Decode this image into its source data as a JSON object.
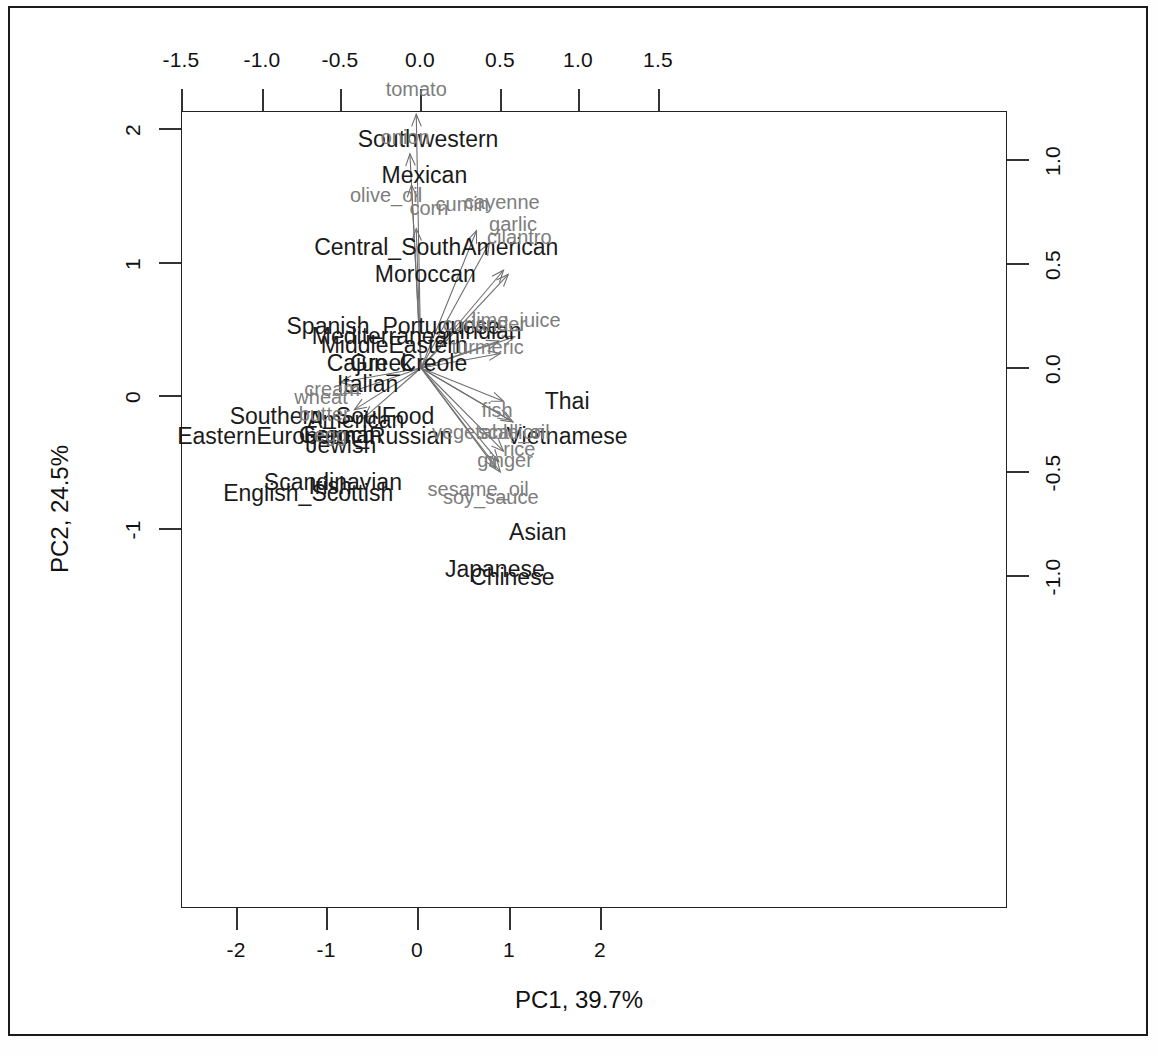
{
  "figure": {
    "type": "pca-biplot",
    "x_axis_title": "PC1, 39.7%",
    "y_axis_title": "PC2, 24.5%"
  },
  "chart_data": {
    "type": "scatter",
    "title": "",
    "subtitle": "",
    "xlabel": "PC1, 39.7%",
    "ylabel": "PC2, 24.5%",
    "grid": false,
    "legend": "none",
    "bottom_axis": {
      "name": "PC1 scores",
      "ticks": [
        -2,
        -1,
        0,
        1,
        2
      ],
      "tick_labels": [
        "-2",
        "-1",
        "0",
        "1",
        "2"
      ],
      "xlim": [
        -2.95,
        2.45
      ]
    },
    "top_axis": {
      "name": "PC1 loadings",
      "ticks": [
        -1.5,
        -1.0,
        -0.5,
        0.0,
        0.5,
        1.0,
        1.5
      ],
      "tick_labels": [
        "-1.5",
        "-1.0",
        "-0.5",
        "0.0",
        "0.5",
        "1.0",
        "1.5"
      ],
      "xlim": [
        -1.63,
        1.63
      ]
    },
    "left_axis": {
      "name": "PC2 scores",
      "ticks": [
        2,
        1,
        0,
        -1
      ],
      "tick_labels": [
        "2",
        "1",
        "0",
        "-1"
      ],
      "ylim": [
        -1.55,
        2.2
      ]
    },
    "right_axis": {
      "name": "PC2 loadings",
      "ticks": [
        1.0,
        0.5,
        0.0,
        -0.5,
        -1.0
      ],
      "tick_labels": [
        "1.0",
        "0.5",
        "0.0",
        "-0.5",
        "-1.0"
      ],
      "ylim": [
        -1.24,
        1.24
      ]
    },
    "observations": [
      {
        "label": "Southwestern",
        "x": 0.11,
        "y": 1.93
      },
      {
        "label": "Mexican",
        "x": 0.07,
        "y": 1.66
      },
      {
        "label": "Central_SouthAmerican",
        "x": 0.2,
        "y": 1.12
      },
      {
        "label": "Moroccan",
        "x": 0.08,
        "y": 0.92
      },
      {
        "label": "Spanish_Portuguese",
        "x": -0.27,
        "y": 0.53
      },
      {
        "label": "Mediterranean",
        "x": -0.35,
        "y": 0.45
      },
      {
        "label": "MiddleEastern",
        "x": -0.26,
        "y": 0.38
      },
      {
        "label": "Greek",
        "x": -0.4,
        "y": 0.25
      },
      {
        "label": "Cajun_Creole",
        "x": -0.23,
        "y": 0.25
      },
      {
        "label": "Italian",
        "x": -0.55,
        "y": 0.09
      },
      {
        "label": "Indian",
        "x": 0.79,
        "y": 0.49
      },
      {
        "label": "Thai",
        "x": 1.63,
        "y": -0.04
      },
      {
        "label": "Vietnamese",
        "x": 1.63,
        "y": -0.3
      },
      {
        "label": "Southern_SoulFood",
        "x": -0.94,
        "y": -0.15
      },
      {
        "label": "American",
        "x": -0.68,
        "y": -0.18
      },
      {
        "label": "EasternEuropean_Russian",
        "x": -1.13,
        "y": -0.3
      },
      {
        "label": "French",
        "x": -0.86,
        "y": -0.29
      },
      {
        "label": "German",
        "x": -0.85,
        "y": -0.29
      },
      {
        "label": "Jewish",
        "x": -0.84,
        "y": -0.37
      },
      {
        "label": "Scandinavian",
        "x": -0.93,
        "y": -0.65
      },
      {
        "label": "Irish",
        "x": -0.96,
        "y": -0.68
      },
      {
        "label": "English_Scottish",
        "x": -1.2,
        "y": -0.73
      },
      {
        "label": "Asian",
        "x": 1.31,
        "y": -1.02
      },
      {
        "label": "Japanese",
        "x": 0.84,
        "y": -1.3
      },
      {
        "label": "Chinese",
        "x": 1.03,
        "y": -1.36
      }
    ],
    "loading_vectors": [
      {
        "label": "tomato",
        "x": -0.03,
        "y": 1.22,
        "label_x": -0.03,
        "label_y": 1.34
      },
      {
        "label": "onion",
        "x": -0.07,
        "y": 1.03,
        "label_x": -0.1,
        "label_y": 1.11
      },
      {
        "label": "olive_oil",
        "x": -0.06,
        "y": 0.88,
        "label_x": -0.22,
        "label_y": 0.83
      },
      {
        "label": "corn",
        "x": -0.03,
        "y": 0.67,
        "label_x": 0.05,
        "label_y": 0.77
      },
      {
        "label": "cumin",
        "x": 0.35,
        "y": 0.66,
        "label_x": 0.26,
        "label_y": 0.79
      },
      {
        "label": "cayenne",
        "x": 0.43,
        "y": 0.6,
        "label_x": 0.51,
        "label_y": 0.8
      },
      {
        "label": "garlic",
        "x": 0.52,
        "y": 0.47,
        "label_x": 0.58,
        "label_y": 0.69
      },
      {
        "label": "cilantro",
        "x": 0.55,
        "y": 0.45,
        "label_x": 0.62,
        "label_y": 0.63
      },
      {
        "label": "coriander",
        "x": 0.49,
        "y": 0.13,
        "label_x": 0.4,
        "label_y": 0.21
      },
      {
        "label": "lime_juice",
        "x": 0.59,
        "y": 0.15,
        "label_x": 0.6,
        "label_y": 0.23
      },
      {
        "label": "turmeric",
        "x": 0.5,
        "y": 0.07,
        "label_x": 0.42,
        "label_y": 0.1
      },
      {
        "label": "fish",
        "x": 0.52,
        "y": -0.16,
        "label_x": 0.48,
        "label_y": -0.2
      },
      {
        "label": "vegetable_oil",
        "x": 0.56,
        "y": -0.25,
        "label_x": 0.44,
        "label_y": -0.31
      },
      {
        "label": "scallion",
        "x": 0.58,
        "y": -0.26,
        "label_x": 0.57,
        "label_y": -0.31
      },
      {
        "label": "ginger",
        "x": 0.49,
        "y": -0.45,
        "label_x": 0.53,
        "label_y": -0.44
      },
      {
        "label": "rice",
        "x": 0.52,
        "y": -0.4,
        "label_x": 0.62,
        "label_y": -0.39
      },
      {
        "label": "sesame_oil",
        "x": 0.47,
        "y": -0.48,
        "label_x": 0.36,
        "label_y": -0.58
      },
      {
        "label": "soy_sauce",
        "x": 0.5,
        "y": -0.5,
        "label_x": 0.44,
        "label_y": -0.62
      },
      {
        "label": "cream",
        "x": -0.51,
        "y": -0.07,
        "label_x": -0.56,
        "label_y": -0.1
      },
      {
        "label": "wheat",
        "x": -0.46,
        "y": -0.12,
        "label_x": -0.63,
        "label_y": -0.14
      },
      {
        "label": "butter",
        "x": -0.42,
        "y": -0.2,
        "label_x": -0.61,
        "label_y": -0.22
      },
      {
        "label": "egg",
        "x": -0.36,
        "y": -0.24,
        "label_x": -0.57,
        "label_y": -0.32
      }
    ]
  }
}
